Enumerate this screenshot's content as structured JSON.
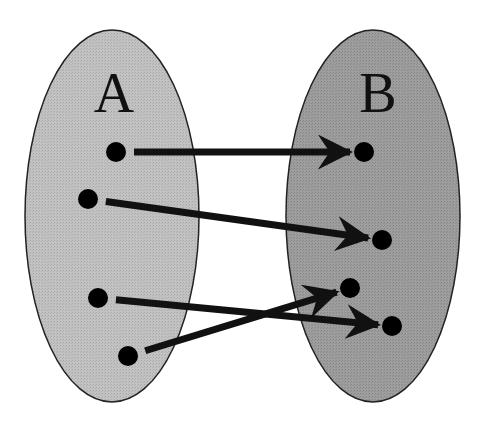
{
  "diagram": {
    "type": "mapping",
    "colors": {
      "background": "#ffffff",
      "set_a_fill": "#bdbdbd",
      "set_b_fill": "#9a9a9a",
      "outline": "#222222",
      "dot": "#000000",
      "arrow": "#111111"
    },
    "sets": [
      {
        "id": "A",
        "label": "A",
        "cx": 112,
        "cy": 216,
        "rx": 87,
        "ry": 186,
        "label_x": 114,
        "label_y": 112
      },
      {
        "id": "B",
        "label": "B",
        "cx": 373,
        "cy": 216,
        "rx": 87,
        "ry": 186,
        "label_x": 378,
        "label_y": 112
      }
    ],
    "points": {
      "A": [
        {
          "id": "a1",
          "x": 116,
          "y": 152
        },
        {
          "id": "a2",
          "x": 88,
          "y": 199
        },
        {
          "id": "a3",
          "x": 98,
          "y": 298
        },
        {
          "id": "a4",
          "x": 128,
          "y": 356
        }
      ],
      "B": [
        {
          "id": "b1",
          "x": 364,
          "y": 152
        },
        {
          "id": "b2",
          "x": 382,
          "y": 240
        },
        {
          "id": "b3",
          "x": 350,
          "y": 288
        },
        {
          "id": "b4",
          "x": 392,
          "y": 326
        }
      ]
    },
    "mappings": [
      {
        "from": "a1",
        "to": "b1"
      },
      {
        "from": "a2",
        "to": "b2"
      },
      {
        "from": "a3",
        "to": "b4"
      },
      {
        "from": "a4",
        "to": "b3"
      }
    ]
  }
}
